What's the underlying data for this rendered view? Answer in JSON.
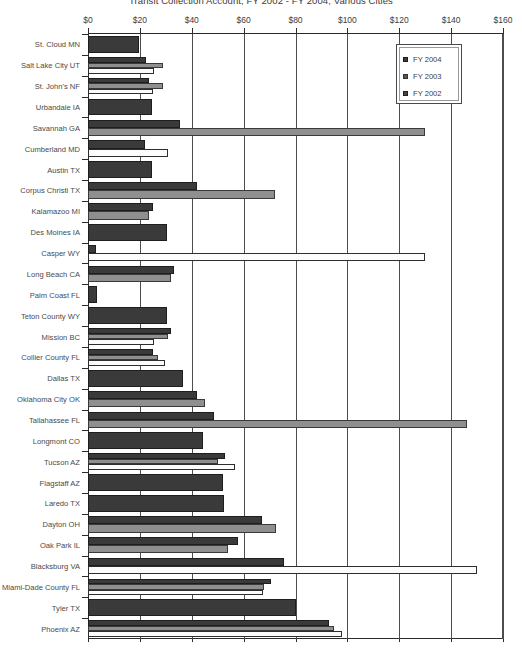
{
  "chart_data": {
    "type": "bar",
    "orientation": "horizontal",
    "title": "Transit Collection Account, FY 2002 - FY 2004, Various Cities",
    "xlabel": "",
    "ylabel": "",
    "xlim": [
      0,
      160
    ],
    "xticks": [
      0,
      20,
      40,
      60,
      80,
      100,
      120,
      140,
      160
    ],
    "xtick_labels": [
      "$0",
      "$20",
      "$40",
      "$60",
      "$80",
      "$100",
      "$120",
      "$140",
      "$160"
    ],
    "grid": true,
    "legend_position": "top-right",
    "legend": [
      "FY 2004",
      "FY 2003",
      "FY 2002"
    ],
    "categories": [
      "St. Cloud MN",
      "Salt Lake City UT",
      "St. John's NF",
      "Urbandale IA",
      "Savannah GA",
      "Cumberland MD",
      "Austin TX",
      "Corpus Christi TX",
      "Kalamazoo MI",
      "Des Moines IA",
      "Casper WY",
      "Long Beach CA",
      "Palm Coast FL",
      "Teton County WY",
      "Mission BC",
      "Collier County FL",
      "Dallas TX",
      "Oklahoma City OK",
      "Tallahassee FL",
      "Longmont CO",
      "Tucson AZ",
      "Flagstaff AZ",
      "Laredo TX",
      "Dayton OH",
      "Oak Park IL",
      "Blacksburg VA",
      "Miami-Dade County FL",
      "Tyler TX",
      "Phoenix AZ"
    ],
    "series": [
      {
        "name": "FY 2004",
        "color": "#3a3a3a",
        "values": [
          19.5,
          22.5,
          23.5,
          24.5,
          35.5,
          22.0,
          24.5,
          42.0,
          25.0,
          30.5,
          3.0,
          33.0,
          3.5,
          30.5,
          32.0,
          25.0,
          36.5,
          42.0,
          48.5,
          44.5,
          53.0,
          52.0,
          52.5,
          67.0,
          58.0,
          75.5,
          70.5,
          80.0,
          93.0
        ]
      },
      {
        "name": "FY 2003",
        "color": "#8f8f8f",
        "values": [
          0,
          29.0,
          29.0,
          0,
          130.0,
          0,
          0,
          72.0,
          23.5,
          0,
          0,
          32.0,
          0,
          0,
          31.0,
          27.0,
          0,
          45.0,
          146.0,
          0,
          50.0,
          0,
          0,
          72.5,
          54.0,
          0,
          68.0,
          0,
          95.0
        ]
      },
      {
        "name": "FY 2002",
        "color": "#fcfcfc",
        "values": [
          0,
          25.5,
          25.0,
          0,
          0,
          31.0,
          0,
          0,
          0,
          0,
          130.0,
          0,
          0,
          0,
          25.5,
          29.5,
          0,
          0,
          0,
          0,
          56.5,
          0,
          0,
          0,
          0,
          150.0,
          67.5,
          0,
          98.0
        ]
      }
    ]
  }
}
